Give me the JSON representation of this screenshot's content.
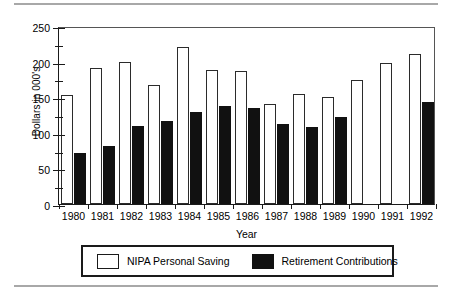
{
  "chart_data": {
    "type": "bar",
    "title": "",
    "xlabel": "Year",
    "ylabel": "Dollars in 000's",
    "ylim": [
      0,
      250
    ],
    "yticks": [
      0,
      50,
      100,
      150,
      200,
      250
    ],
    "ytick_labels": [
      "0",
      "50",
      "100",
      "150",
      "200",
      "250"
    ],
    "yminor_ticks": [
      25,
      75,
      125,
      175,
      225
    ],
    "grid": false,
    "legend_position": "bottom",
    "categories": [
      "1980",
      "1981",
      "1982",
      "1983",
      "1984",
      "1985",
      "1986",
      "1987",
      "1988",
      "1989",
      "1990",
      "1991",
      "1992"
    ],
    "series": [
      {
        "name": "NIPA Personal Saving",
        "color": "#ffffff",
        "edge_color": "#2b2b2b",
        "values": [
          153,
          191,
          199,
          167,
          221,
          188,
          187,
          141,
          155,
          151,
          174,
          198,
          211
        ]
      },
      {
        "name": "Retirement Contributions",
        "color": "#111111",
        "edge_color": "#111111",
        "values": [
          72,
          82,
          109,
          117,
          129,
          138,
          135,
          112,
          108,
          122,
          null,
          null,
          143
        ]
      }
    ]
  },
  "legend": {
    "entries": [
      {
        "label": "NIPA Personal Saving",
        "swatch": "open-square-swatch"
      },
      {
        "label": "Retirement Contributions",
        "swatch": "filled-square-swatch"
      }
    ]
  }
}
